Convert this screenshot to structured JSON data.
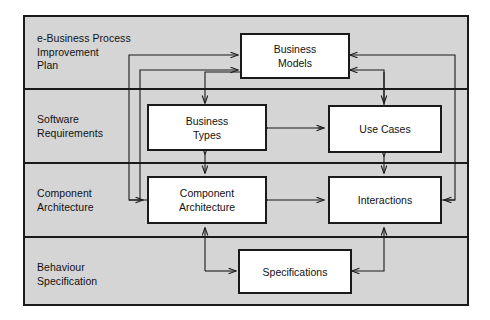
{
  "diagram": {
    "background_color": "#d5d5d5",
    "frame_color": "#1a1a1a",
    "node_fill": "#ffffff",
    "page_background": "#ffffff",
    "lanes": [
      {
        "id": "lane-ebusiness",
        "label": "e-Business Process\nImprovement\nPlan"
      },
      {
        "id": "lane-software",
        "label": "Software\nRequirements"
      },
      {
        "id": "lane-component",
        "label": "Component\nArchitecture"
      },
      {
        "id": "lane-behaviour",
        "label": "Behaviour\nSpecification"
      }
    ],
    "nodes": [
      {
        "id": "node-business-models",
        "label": "Business\nModels",
        "lane": "lane-ebusiness"
      },
      {
        "id": "node-business-types",
        "label": "Business\nTypes",
        "lane": "lane-software"
      },
      {
        "id": "node-use-cases",
        "label": "Use Cases",
        "lane": "lane-software"
      },
      {
        "id": "node-component-architecture",
        "label": "Component\nArchitecture",
        "lane": "lane-component"
      },
      {
        "id": "node-interactions",
        "label": "Interactions",
        "lane": "lane-component"
      },
      {
        "id": "node-specifications",
        "label": "Specifications",
        "lane": "lane-behaviour"
      }
    ],
    "edges": [
      {
        "id": "edge-component-architecture-to-business-models",
        "from": "node-component-architecture",
        "to": "node-business-models",
        "direction": "one-way"
      },
      {
        "id": "edge-business-models-to-component-architecture",
        "from": "node-business-models",
        "to": "node-component-architecture",
        "direction": "one-way"
      },
      {
        "id": "edge-interactions-to-business-models",
        "from": "node-interactions",
        "to": "node-business-models",
        "direction": "one-way"
      },
      {
        "id": "edge-business-models-to-use-cases",
        "from": "node-business-models",
        "to": "node-use-cases",
        "direction": "one-way"
      },
      {
        "id": "edge-business-types-to-use-cases",
        "from": "node-business-types",
        "to": "node-use-cases",
        "direction": "two-way"
      },
      {
        "id": "edge-business-types-to-component-architecture",
        "from": "node-business-types",
        "to": "node-component-architecture",
        "direction": "two-way"
      },
      {
        "id": "edge-use-cases-to-interactions",
        "from": "node-use-cases",
        "to": "node-interactions",
        "direction": "two-way"
      },
      {
        "id": "edge-component-architecture-to-interactions",
        "from": "node-component-architecture",
        "to": "node-interactions",
        "direction": "two-way"
      },
      {
        "id": "edge-specifications-to-component-architecture",
        "from": "node-specifications",
        "to": "node-component-architecture",
        "direction": "one-way"
      },
      {
        "id": "edge-interactions-to-specifications",
        "from": "node-interactions",
        "to": "node-specifications",
        "direction": "one-way"
      },
      {
        "id": "edge-use-cases-to-business-types",
        "from": "node-use-cases",
        "to": "node-business-types",
        "direction": "one-way"
      }
    ]
  }
}
